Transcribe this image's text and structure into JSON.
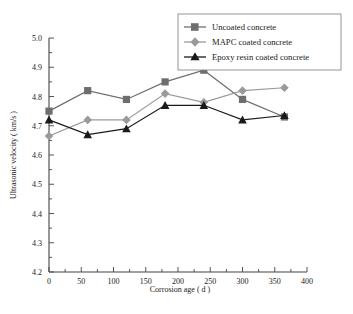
{
  "chart_data": {
    "type": "line",
    "title": "",
    "xlabel": "Corrosion age ( d )",
    "ylabel": "Ultrasonic velocity ( km/s )",
    "xlim": [
      0,
      400
    ],
    "ylim": [
      4.2,
      5.0
    ],
    "xticks": [
      0,
      50,
      100,
      150,
      200,
      250,
      300,
      350,
      400
    ],
    "xtick_labels": [
      "0",
      "50",
      "100",
      "150",
      "200",
      "250",
      "300",
      "350",
      "400"
    ],
    "yticks": [
      4.2,
      4.3,
      4.4,
      4.5,
      4.6,
      4.7,
      4.8,
      4.9,
      5.0
    ],
    "ytick_labels": [
      "4.2",
      "4.3",
      "4.4",
      "4.5",
      "4.6",
      "4.7",
      "4.8",
      "4.9",
      "5.0"
    ],
    "grid": false,
    "legend_position": "top-right",
    "x": [
      0,
      60,
      120,
      180,
      240,
      300,
      365
    ],
    "series": [
      {
        "name": "Uncoated concrete",
        "marker": "square",
        "color": "#6e6e6e",
        "values": [
          4.75,
          4.82,
          4.79,
          4.85,
          4.89,
          4.79,
          4.73
        ]
      },
      {
        "name": "MAPC coated concrete",
        "marker": "diamond",
        "color": "#9a9a9a",
        "values": [
          4.665,
          4.72,
          4.72,
          4.81,
          4.78,
          4.82,
          4.83
        ]
      },
      {
        "name": "Epoxy resin coated concrete",
        "marker": "triangle",
        "color": "#1a1a1a",
        "values": [
          4.72,
          4.67,
          4.69,
          4.77,
          4.77,
          4.72,
          4.735
        ]
      }
    ]
  },
  "legend": {
    "items": [
      {
        "label": "Uncoated concrete"
      },
      {
        "label": "MAPC coated concrete"
      },
      {
        "label": "Epoxy resin coated concrete"
      }
    ]
  },
  "colors": {
    "uncoated": "#6e6e6e",
    "mapc": "#9a9a9a",
    "epoxy": "#1a1a1a",
    "axis": "#444444",
    "text": "#1a1a1a",
    "background": "#ffffff"
  }
}
